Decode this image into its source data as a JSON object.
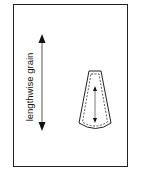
{
  "diagram": {
    "label": "lengthwise grain",
    "colors": {
      "stroke": "#222222",
      "background": "#ffffff"
    },
    "elements": [
      {
        "type": "fabric-frame"
      },
      {
        "type": "double-arrow",
        "direction": "vertical",
        "meaning": "lengthwise grain"
      },
      {
        "type": "pattern-piece",
        "shape": "flared-tapered",
        "has_seam_allowance": true,
        "grainline": "vertical double arrow"
      }
    ]
  }
}
